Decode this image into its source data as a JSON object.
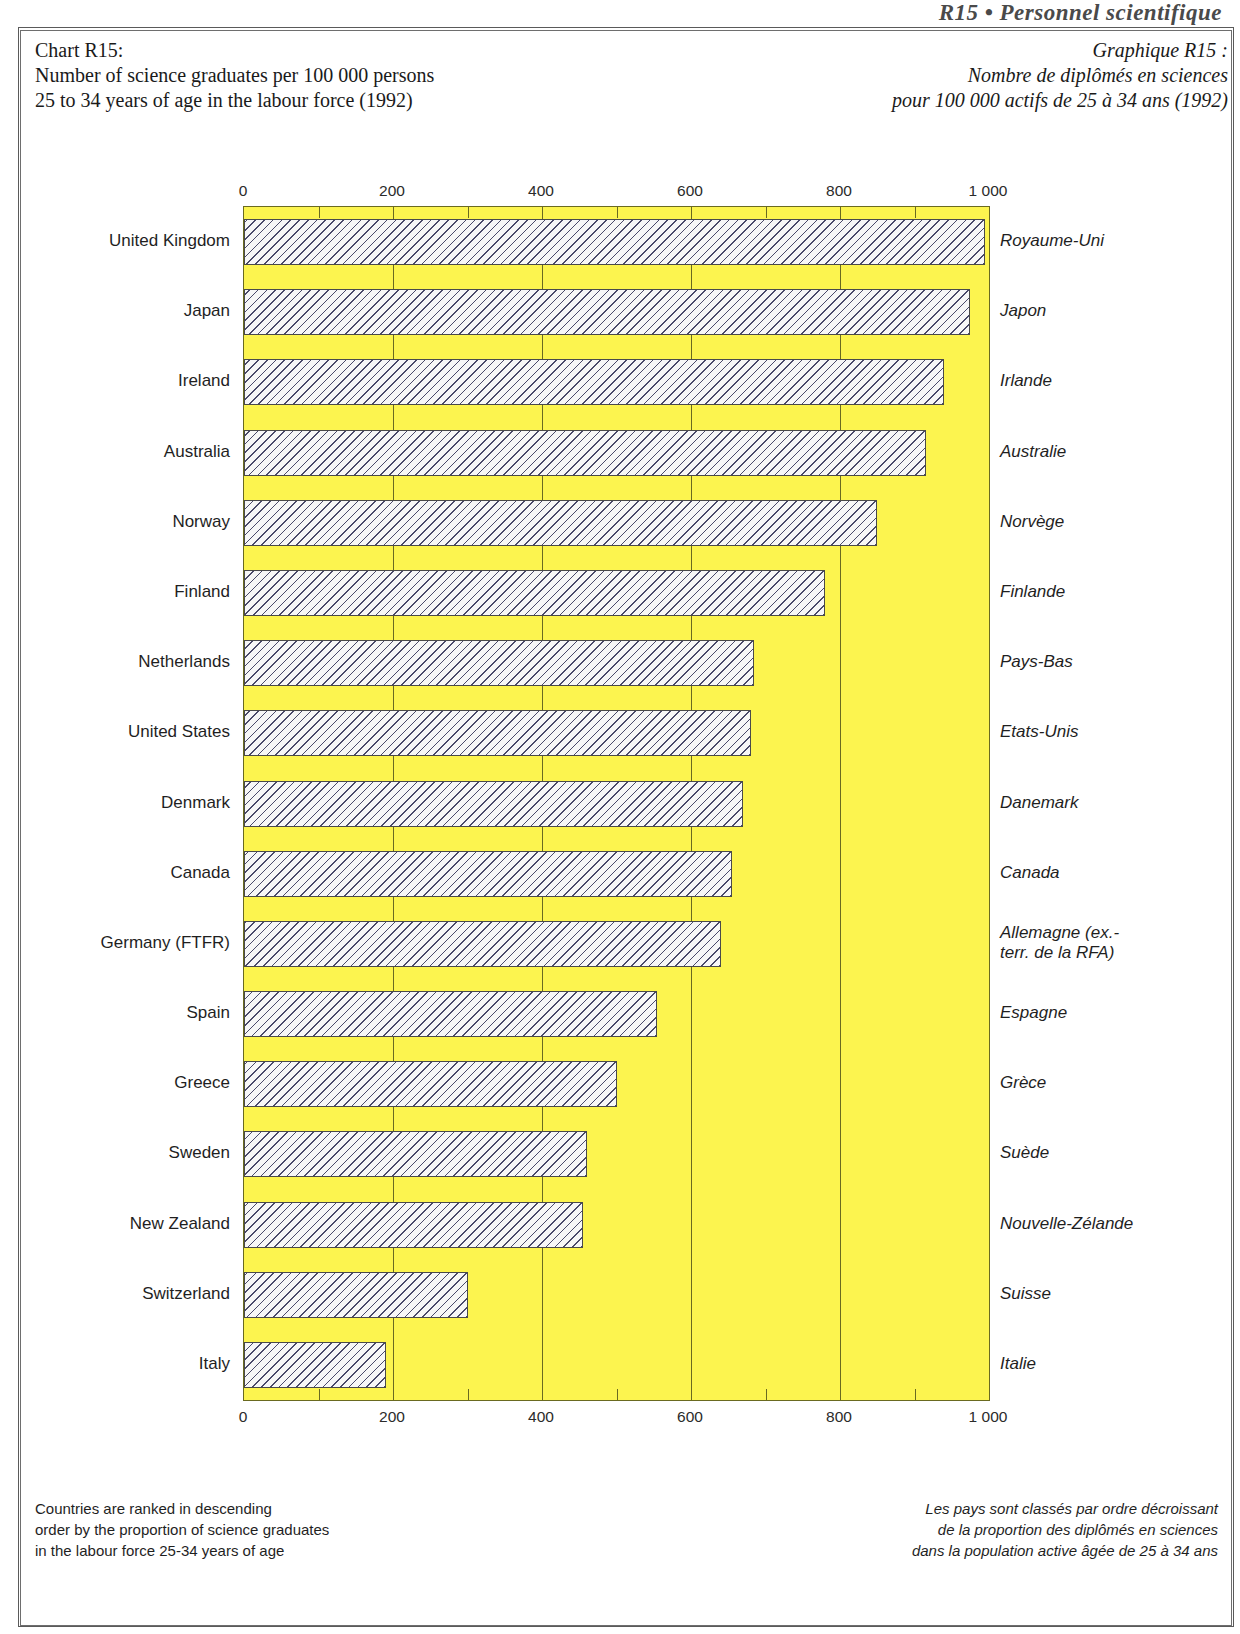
{
  "page": {
    "running_head": "R15 • Personnel scientifique"
  },
  "titles": {
    "english": [
      "Chart R15:",
      "Number of science graduates per 100 000 persons",
      "25 to 34 years of age in the labour force (1992)"
    ],
    "french": [
      "Graphique R15 :",
      "Nombre de diplômés en sciences",
      "pour 100 000 actifs de 25 à 34 ans (1992)"
    ]
  },
  "notes": {
    "english": [
      "Countries are ranked in descending",
      "order by the proportion of science graduates",
      "in the labour force 25-34 years of age"
    ],
    "french": [
      "Les pays sont classés par ordre décroissant",
      "de la proportion des diplômés en sciences",
      "dans la population active âgée de 25 à 34 ans"
    ]
  },
  "colors": {
    "plot_background": "#FCF44F",
    "bar_fill": "#F7F7F7",
    "bar_hatch": "#4a4a6a",
    "frame": "#5a5a5a"
  },
  "chart_data": {
    "type": "bar",
    "orientation": "horizontal",
    "title": "Number of science graduates per 100 000 persons 25 to 34 years of age in the labour force (1992)",
    "title_fr": "Nombre de diplômés en sciences pour 100 000 actifs de 25 à 34 ans (1992)",
    "xlabel": "",
    "ylabel": "",
    "xlim": [
      0,
      1000
    ],
    "xticks": [
      0,
      200,
      400,
      600,
      800,
      1000
    ],
    "xticklabels": [
      "0",
      "200",
      "400",
      "600",
      "800",
      "1 000"
    ],
    "minor_tick_interval": 100,
    "grid": true,
    "legend": null,
    "axis_positions": [
      "top",
      "bottom"
    ],
    "categories": [
      "United Kingdom",
      "Japan",
      "Ireland",
      "Australia",
      "Norway",
      "Finland",
      "Netherlands",
      "United States",
      "Denmark",
      "Canada",
      "Germany (FTFR)",
      "Spain",
      "Greece",
      "Sweden",
      "New Zealand",
      "Switzerland",
      "Italy"
    ],
    "categories_fr": [
      "Royaume-Uni",
      "Japon",
      "Irlande",
      "Australie",
      "Norvège",
      "Finlande",
      "Pays-Bas",
      "Etats-Unis",
      "Danemark",
      "Canada",
      "Allemagne (ex.-\nterr. de la RFA)",
      "Espagne",
      "Grèce",
      "Suède",
      "Nouvelle-Zélande",
      "Suisse",
      "Italie"
    ],
    "values": [
      995,
      975,
      940,
      915,
      850,
      780,
      685,
      680,
      670,
      655,
      640,
      555,
      500,
      460,
      455,
      300,
      190
    ]
  }
}
